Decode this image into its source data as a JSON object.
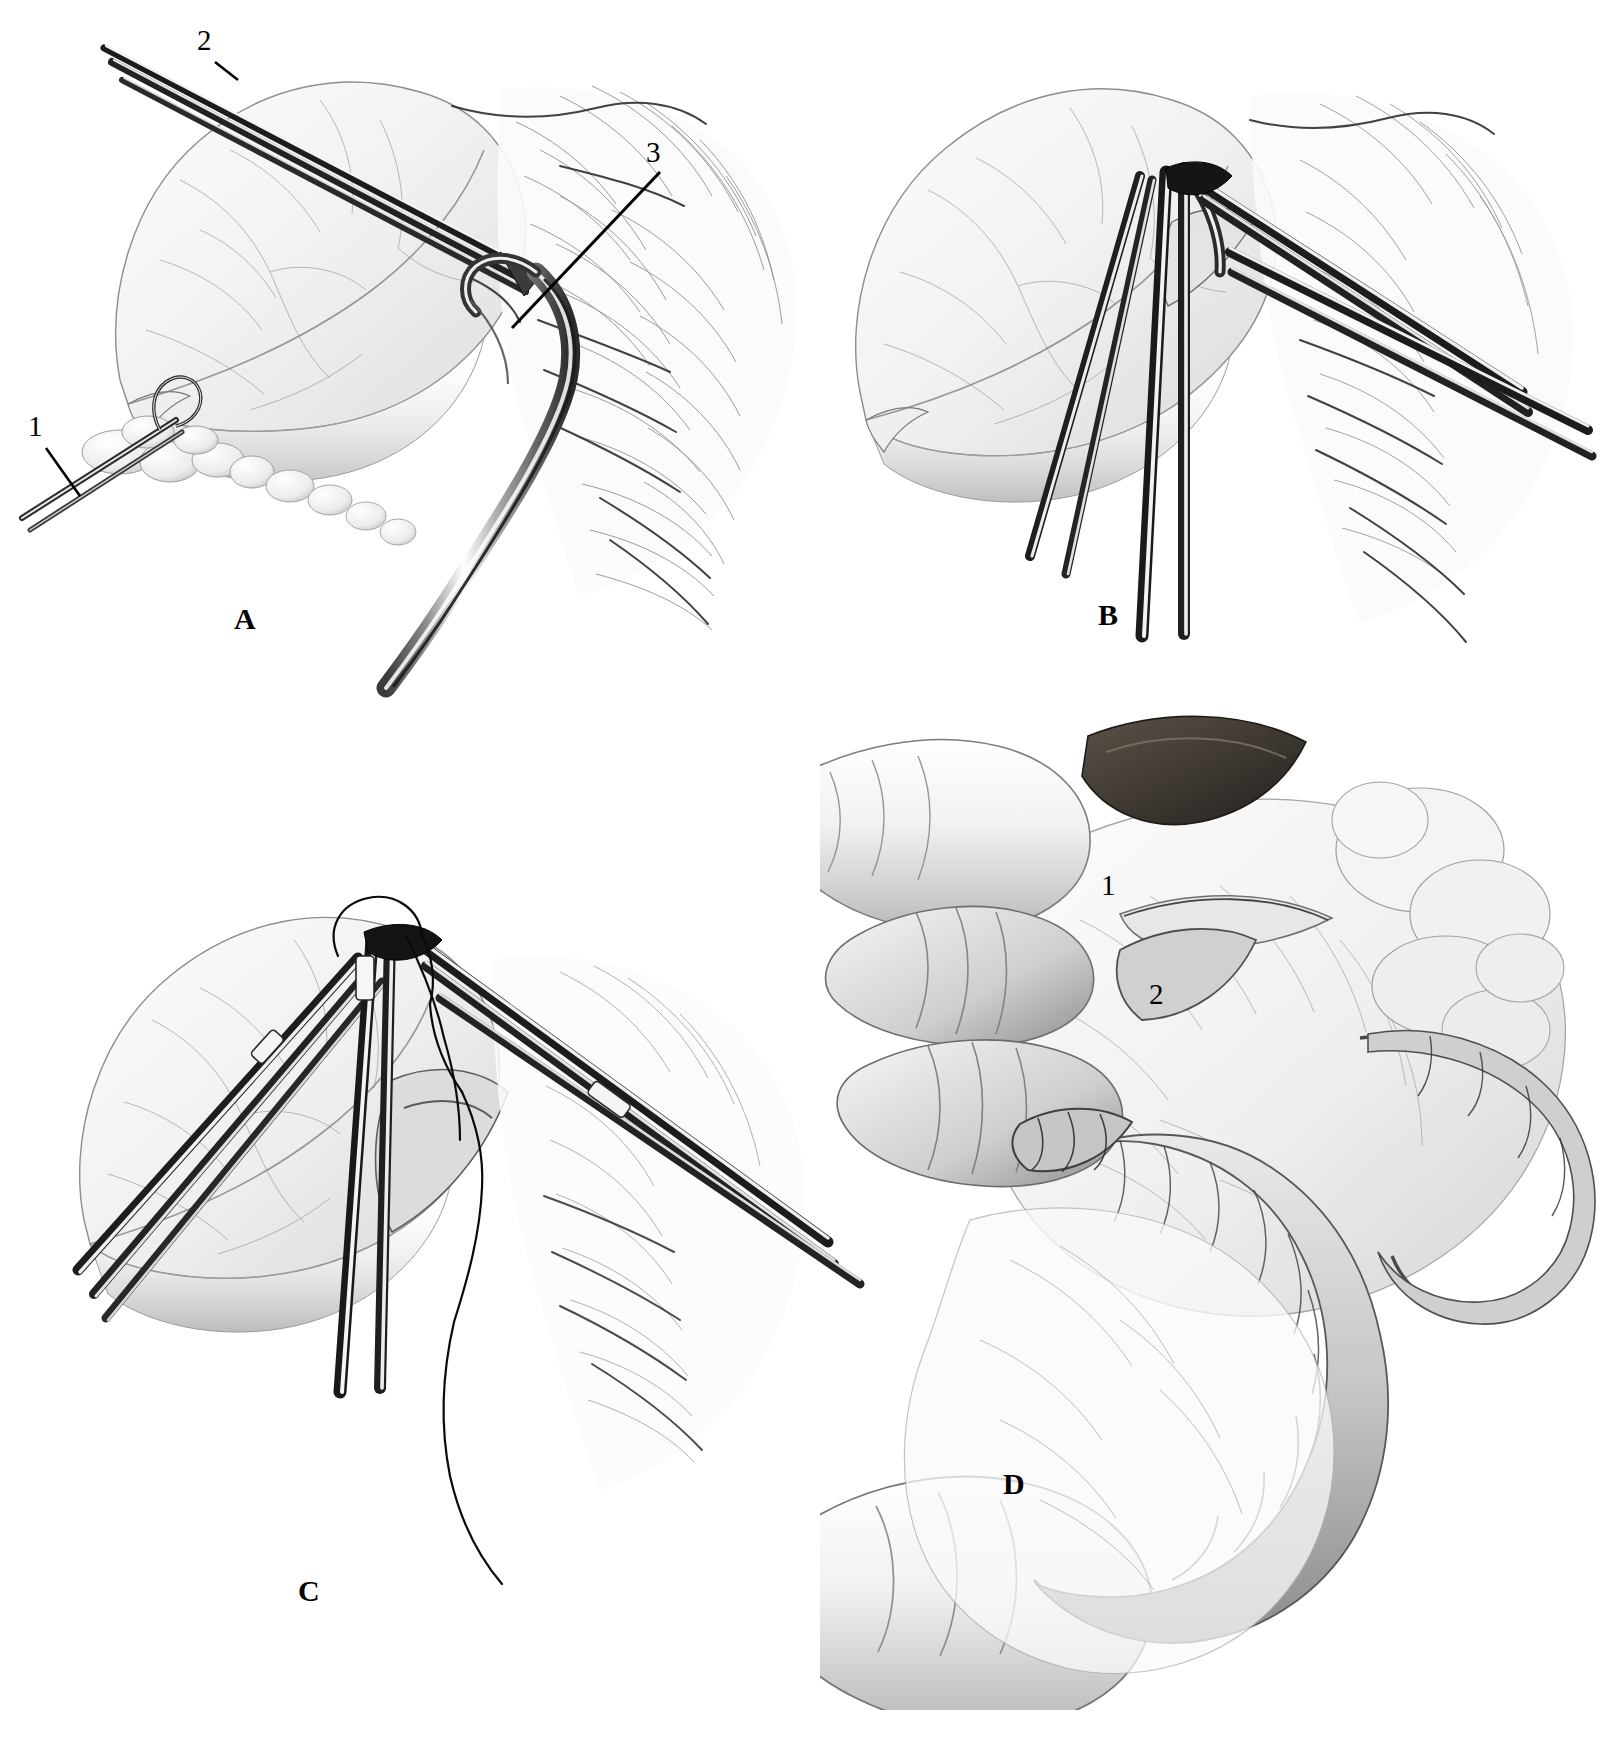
{
  "figure": {
    "style": "graphite pencil medical illustration",
    "background_color": "#ffffff",
    "ink_color": "#000000",
    "width": 1621,
    "height": 1748
  },
  "panels": [
    {
      "id": "A",
      "letter": "A",
      "caption_position": {
        "x": 236,
        "y": 604
      },
      "description": "Gallbladder retracted with forceps; right-angle dissector passed beneath the cystic duct",
      "labels": [
        {
          "key": "1",
          "text": "1",
          "position": {
            "x": 30,
            "y": 415
          },
          "leader": {
            "x1": 46,
            "y1": 446,
            "x2": 78,
            "y2": 492
          }
        },
        {
          "key": "2",
          "text": "2",
          "position": {
            "x": 198,
            "y": 28
          },
          "leader": {
            "x1": 210,
            "y1": 62,
            "x2": 212,
            "y2": 66
          }
        },
        {
          "key": "3",
          "text": "3",
          "position": {
            "x": 645,
            "y": 140
          },
          "leader": {
            "x1": 663,
            "y1": 170,
            "x2": 509,
            "y2": 327
          }
        }
      ]
    },
    {
      "id": "B",
      "letter": "B",
      "caption_position": {
        "x": 1097,
        "y": 600
      },
      "description": "Multiple clamps applied; cystic duct and artery exposed between instruments",
      "labels": []
    },
    {
      "id": "C",
      "letter": "C",
      "caption_position": {
        "x": 264,
        "y": 1434
      },
      "description": "Ligature being passed and tied around the duct with clamps holding the field open",
      "labels": []
    },
    {
      "id": "D",
      "letter": "D",
      "caption_position": {
        "x": 903,
        "y": 1469
      },
      "description": "Surgeon's gloved hand retracting the structure; the freed duct and vessel displayed between fingers",
      "labels": [
        {
          "key": "1",
          "text": "1",
          "position": {
            "x": 1101,
            "y": 871
          },
          "leader": null
        },
        {
          "key": "2",
          "text": "2",
          "position": {
            "x": 1149,
            "y": 980
          },
          "leader": null
        }
      ]
    }
  ]
}
